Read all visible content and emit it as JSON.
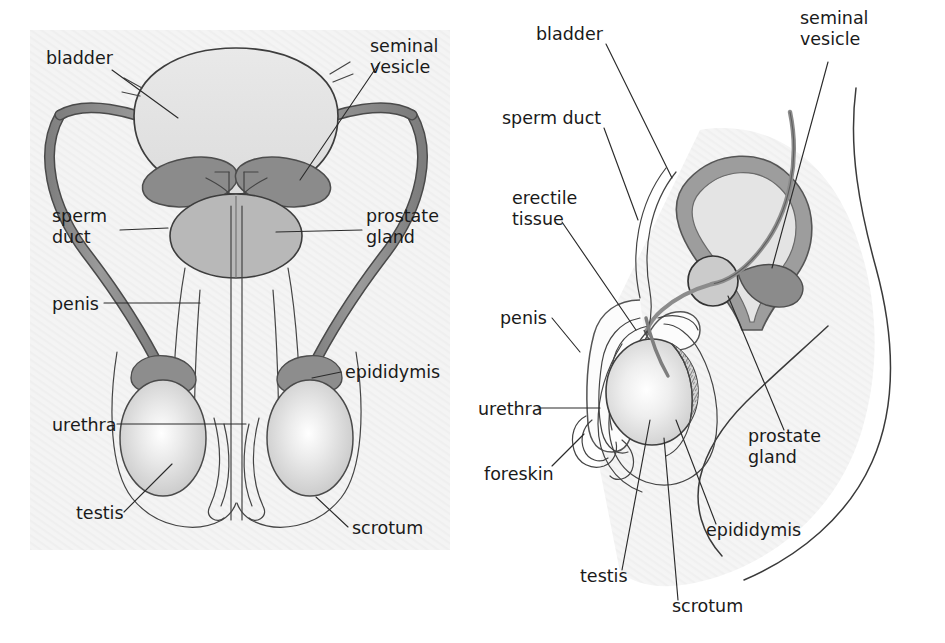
{
  "figure": {
    "panels": [
      {
        "id": "front-view",
        "name": "front view"
      },
      {
        "id": "side-view",
        "name": "side view"
      }
    ]
  },
  "colors": {
    "background": "#ffffff",
    "panel_tint": "#f1f1f1",
    "outline": "#3a3a3a",
    "leader_line": "#2b2b2b",
    "text": "#1a1a1a",
    "bladder_fill": "#e2e2e2",
    "bladder_wall": "#a0a0a0",
    "seminal_vesicle": "#8a8a8a",
    "prostate_fill": "#b8b8b8",
    "sperm_duct": "#8e8e8e",
    "epididymis": "#8d8d8d",
    "testis_light": "#ffffff",
    "testis_mid": "#cfcfcf",
    "erectile_tissue": "#fbfbfb",
    "scrotum_fill": "#fdfdfd"
  },
  "left_panel": {
    "name": "front-view-diagram",
    "labels": [
      {
        "id": "bladder",
        "text": "bladder",
        "x": 46,
        "y": 64,
        "anchor": "start",
        "lines": [
          "bladder"
        ]
      },
      {
        "id": "seminal-vesicle",
        "text": "seminal vesicle",
        "x": 370,
        "y": 52,
        "anchor": "start",
        "lines": [
          "seminal",
          "vesicle"
        ]
      },
      {
        "id": "sperm-duct",
        "text": "sperm duct",
        "x": 52,
        "y": 222,
        "anchor": "start",
        "lines": [
          "sperm",
          "duct"
        ]
      },
      {
        "id": "prostate-gland",
        "text": "prostate gland",
        "x": 366,
        "y": 222,
        "anchor": "start",
        "lines": [
          "prostate",
          "gland"
        ]
      },
      {
        "id": "penis",
        "text": "penis",
        "x": 52,
        "y": 306,
        "anchor": "start",
        "lines": [
          "penis"
        ]
      },
      {
        "id": "epididymis",
        "text": "epididymis",
        "x": 345,
        "y": 372,
        "anchor": "start",
        "lines": [
          "epididymis"
        ]
      },
      {
        "id": "urethra",
        "text": "urethra",
        "x": 52,
        "y": 428,
        "anchor": "start",
        "lines": [
          "urethra"
        ]
      },
      {
        "id": "testis",
        "text": "testis",
        "x": 76,
        "y": 515,
        "anchor": "start",
        "lines": [
          "testis"
        ]
      },
      {
        "id": "scrotum",
        "text": "scrotum",
        "x": 352,
        "y": 530,
        "anchor": "start",
        "lines": [
          "scrotum"
        ]
      }
    ]
  },
  "right_panel": {
    "name": "side-view-diagram",
    "labels": [
      {
        "id": "bladder",
        "text": "bladder",
        "x": 536,
        "y": 36,
        "anchor": "start",
        "lines": [
          "bladder"
        ]
      },
      {
        "id": "seminal-vesicle",
        "text": "seminal vesicle",
        "x": 800,
        "y": 20,
        "anchor": "start",
        "lines": [
          "seminal",
          "vesicle"
        ]
      },
      {
        "id": "sperm-duct",
        "text": "sperm duct",
        "x": 502,
        "y": 120,
        "anchor": "start",
        "lines": [
          "sperm duct"
        ]
      },
      {
        "id": "erectile-tissue",
        "text": "erectile tissue",
        "x": 512,
        "y": 200,
        "anchor": "start",
        "lines": [
          "erectile",
          "tissue"
        ]
      },
      {
        "id": "penis",
        "text": "penis",
        "x": 500,
        "y": 320,
        "anchor": "start",
        "lines": [
          "penis"
        ]
      },
      {
        "id": "urethra",
        "text": "urethra",
        "x": 478,
        "y": 412,
        "anchor": "start",
        "lines": [
          "urethra"
        ]
      },
      {
        "id": "foreskin",
        "text": "foreskin",
        "x": 484,
        "y": 476,
        "anchor": "start",
        "lines": [
          "foreskin"
        ]
      },
      {
        "id": "prostate-gland",
        "text": "prostate gland",
        "x": 748,
        "y": 438,
        "anchor": "start",
        "lines": [
          "prostate",
          "gland"
        ]
      },
      {
        "id": "epididymis",
        "text": "epididymis",
        "x": 706,
        "y": 532,
        "anchor": "start",
        "lines": [
          "epididymis"
        ]
      },
      {
        "id": "testis",
        "text": "testis",
        "x": 580,
        "y": 578,
        "anchor": "start",
        "lines": [
          "testis"
        ]
      },
      {
        "id": "scrotum",
        "text": "scrotum",
        "x": 672,
        "y": 608,
        "anchor": "start",
        "lines": [
          "scrotum"
        ]
      }
    ]
  },
  "anatomy_terms": [
    "bladder",
    "seminal vesicle",
    "sperm duct",
    "prostate gland",
    "penis",
    "epididymis",
    "urethra",
    "testis",
    "scrotum",
    "erectile tissue",
    "foreskin"
  ]
}
